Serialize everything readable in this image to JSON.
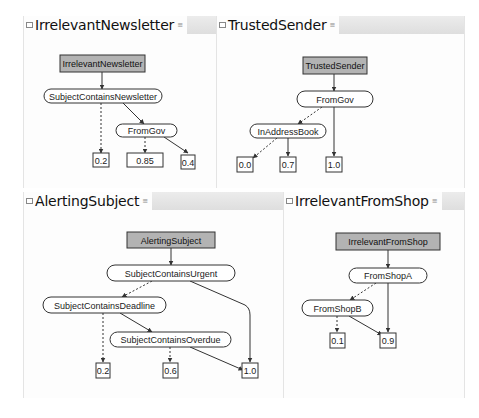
{
  "colors": {
    "root_fill": "#b3b3b3",
    "node_stroke": "#333333",
    "edge": "#333333",
    "tabbar": "#e2e2e2"
  },
  "panels": [
    {
      "title": "IrrelevantNewsletter",
      "root": "IrrelevantNewsletter",
      "nodes": [
        "SubjectContainsNewsletter",
        "FromGov"
      ],
      "leaves": [
        "0.2",
        "0.85",
        "0.4"
      ]
    },
    {
      "title": "TrustedSender",
      "root": "TrustedSender",
      "nodes": [
        "FromGov",
        "InAddressBook"
      ],
      "leaves": [
        "0.0",
        "0.7",
        "1.0"
      ]
    },
    {
      "title": "AlertingSubject",
      "root": "AlertingSubject",
      "nodes": [
        "SubjectContainsUrgent",
        "SubjectContainsDeadline",
        "SubjectContainsOverdue"
      ],
      "leaves": [
        "0.2",
        "0.6",
        "1.0"
      ]
    },
    {
      "title": "IrrelevantFromShop",
      "root": "IrrelevantFromShop",
      "nodes": [
        "FromShopA",
        "FromShopB"
      ],
      "leaves": [
        "0.1",
        "0.9"
      ]
    }
  ]
}
